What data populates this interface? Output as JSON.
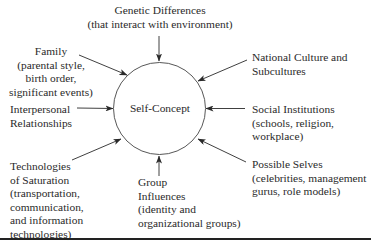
{
  "diagram": {
    "center": {
      "label": "Self-Concept"
    },
    "influences": {
      "genetic": {
        "lines": [
          "Genetic Differences",
          "(that interact with environment)"
        ]
      },
      "family": {
        "lines": [
          "Family",
          "(parental style,",
          "birth order,",
          "significant events)"
        ]
      },
      "interpersonal": {
        "lines": [
          "Interpersonal",
          "Relationships"
        ]
      },
      "technologies": {
        "lines": [
          "Technologies",
          "of Saturation",
          "(transportation,",
          "communication,",
          "and information",
          "technologies)"
        ]
      },
      "group": {
        "lines": [
          "Group",
          "Influences",
          "(identity and",
          "organizational groups)"
        ]
      },
      "national": {
        "lines": [
          "National Culture and",
          "Subcultures"
        ]
      },
      "social": {
        "lines": [
          "Social Institutions",
          "(schools, religion,",
          "workplace)"
        ]
      },
      "possible": {
        "lines": [
          "Possible Selves",
          "(celebrities, management",
          "gurus, role models)"
        ]
      }
    },
    "colors": {
      "ink": "#2a2a2a",
      "background": "#ffffff"
    }
  }
}
